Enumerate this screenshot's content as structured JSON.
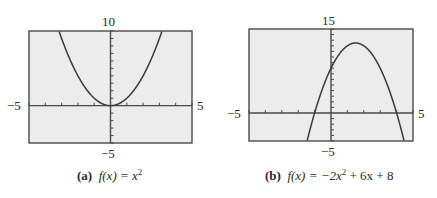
{
  "chart_data": [
    {
      "type": "line",
      "panel_label": "(a)",
      "title": "f(x) = x²",
      "function": "x^2",
      "coefficients": {
        "a": 1,
        "b": 0,
        "c": 0
      },
      "xlim": [
        -5,
        5
      ],
      "ylim": [
        -5,
        10
      ],
      "xscl": 1,
      "yscl": 1,
      "tick_labels": {
        "xmin": "−5",
        "xmax": "5",
        "ymin": "−5",
        "ymax": "10"
      },
      "vertex": [
        0,
        0
      ],
      "x": [
        -3.16,
        -3,
        -2,
        -1,
        0,
        1,
        2,
        3,
        3.16
      ],
      "y": [
        10,
        9,
        4,
        1,
        0,
        1,
        4,
        9,
        10
      ],
      "grid": false
    },
    {
      "type": "line",
      "panel_label": "(b)",
      "title": "f(x) = −2x² + 6x + 8",
      "function": "-2x^2 + 6x + 8",
      "coefficients": {
        "a": -2,
        "b": 6,
        "c": 8
      },
      "xlim": [
        -5,
        5
      ],
      "ylim": [
        -5,
        15
      ],
      "xscl": 1,
      "yscl": 1,
      "tick_labels": {
        "xmin": "−5",
        "xmax": "5",
        "ymin": "−5",
        "ymax": "15"
      },
      "vertex": [
        1.5,
        12.5
      ],
      "x_intercepts": [
        -1,
        4
      ],
      "y_intercept": 8,
      "x": [
        -1.5,
        -1,
        0,
        1,
        1.5,
        2,
        3,
        4,
        4.5
      ],
      "y": [
        -5,
        0,
        8,
        12,
        12.5,
        12,
        8,
        0,
        -5
      ],
      "grid": false
    }
  ],
  "panels": [
    {
      "label": "(a)",
      "caption_prefix": "f(x) = x",
      "caption_sup": "2",
      "caption_suffix": "",
      "ymax_label": "10",
      "ymin_label": "−5",
      "xmin_label": "−5",
      "xmax_label": "5"
    },
    {
      "label": "(b)",
      "caption_prefix": "f(x) = −2x",
      "caption_sup": "2",
      "caption_suffix": " + 6x + 8",
      "ymax_label": "15",
      "ymin_label": "−5",
      "xmin_label": "−5",
      "xmax_label": "5"
    }
  ],
  "colors": {
    "plot_bg": "#ececec",
    "frame": "#4a4a4a",
    "curve": "#3a3a3a",
    "text": "#2a2a2a"
  }
}
